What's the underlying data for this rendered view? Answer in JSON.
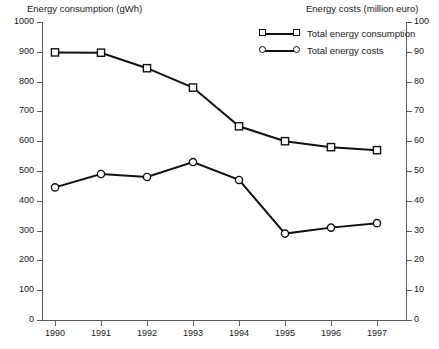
{
  "chart_data": {
    "type": "line",
    "title": "",
    "xlabel": "",
    "ylabel": "Energy consumption (gWh)",
    "y2label": "Energy costs (million euro)",
    "categories": [
      "1990",
      "1991",
      "1992",
      "1993",
      "1994",
      "1995",
      "1996",
      "1997"
    ],
    "grid": false,
    "legend_position": "top-right",
    "ylim": [
      0,
      1000
    ],
    "y2lim": [
      0,
      100
    ],
    "yticks": [
      "0",
      "100",
      "200",
      "300",
      "400",
      "500",
      "600",
      "700",
      "800",
      "900",
      "1000"
    ],
    "y2ticks": [
      "0",
      "10",
      "20",
      "30",
      "40",
      "50",
      "60",
      "70",
      "80",
      "90",
      "100"
    ],
    "series": [
      {
        "name": "Total energy consumption",
        "axis": "left",
        "marker": "square",
        "color": "#111111",
        "values": [
          898,
          897,
          845,
          780,
          650,
          600,
          580,
          570
        ]
      },
      {
        "name": "Total energy costs",
        "axis": "right",
        "marker": "circle",
        "color": "#111111",
        "values": [
          44.5,
          49,
          48,
          53,
          47,
          29,
          31,
          32.5
        ]
      }
    ]
  },
  "legend": {
    "items": [
      {
        "label": "Total energy consumption",
        "marker": "square"
      },
      {
        "label": "Total energy costs",
        "marker": "circle"
      }
    ]
  }
}
